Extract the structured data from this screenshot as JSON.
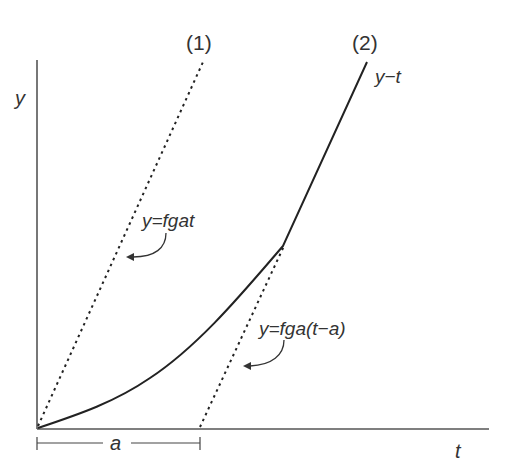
{
  "diagram": {
    "axes": {
      "y_label": "y",
      "x_label": "t"
    },
    "curves": [
      {
        "id": "1",
        "label": "(1)",
        "style": "dotted",
        "equation": "y=fgat"
      },
      {
        "id": "2",
        "label": "(2)",
        "style": "solid",
        "name": "y−t"
      },
      {
        "id": "asymptote",
        "style": "dotted",
        "equation": "y=fga(t−a)"
      }
    ],
    "interval": {
      "label": "a"
    }
  },
  "colors": {
    "line": "#222222",
    "axis": "#555555",
    "text": "#333333"
  }
}
